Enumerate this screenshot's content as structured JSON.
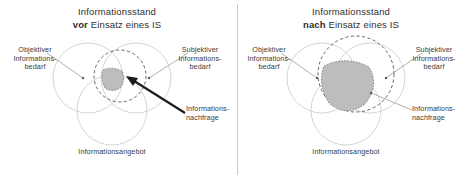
{
  "panels": [
    {
      "id": "before",
      "title_line1": "Informationsstand",
      "title_emphasis": "vor",
      "title_rest": "Einsatz eines IS",
      "labels": {
        "objective": "Objektiver\nInformations-\nbedarf",
        "objective_l1": "Objektiver",
        "objective_l2": "Informations-",
        "objective_l3": "bedarf",
        "subjective_l1": "Subjektiver",
        "subjective_l2": "Informations-",
        "subjective_l3": "bedarf",
        "demand_l1": "Informations-",
        "demand_l2": "nachfrage",
        "supply": "Informationsangebot"
      }
    },
    {
      "id": "after",
      "title_line1": "Informationsstand",
      "title_emphasis": "nach",
      "title_rest": "Einsatz eines IS",
      "labels": {
        "objective_l1": "Objektiver",
        "objective_l2": "Informations-",
        "objective_l3": "bedarf",
        "subjective_l1": "Subjektiver",
        "subjective_l2": "Informations-",
        "subjective_l3": "bedarf",
        "demand_l1": "Informations-",
        "demand_l2": "nachfrage",
        "supply": "Informationsangebot"
      }
    }
  ],
  "colors": {
    "circle_stroke": "#cfcfcf",
    "dashed_stroke": "#4a4a4a",
    "shade_fill": "#bdbdbd",
    "text": "#3a3a3a",
    "arrow": "#1b1b1b",
    "divider": "#c9c9c9",
    "background": "#ffffff"
  },
  "diagram": {
    "type": "venn",
    "sets": [
      "Objektiver Informationsbedarf",
      "Subjektiver Informationsbedarf",
      "Informationsangebot",
      "Informationsnachfrage"
    ],
    "shaded_meaning": "intersection of all sets",
    "before_shaded_relative_size": "small",
    "after_shaded_relative_size": "large"
  }
}
